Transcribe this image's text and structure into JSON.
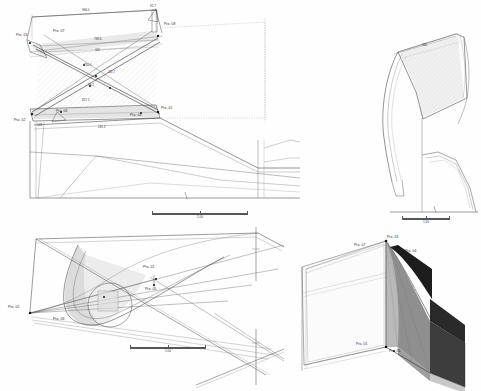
{
  "drawing": {
    "title": "Technical CAD Drawing - Four View Layout",
    "background_color": "#ffffff",
    "line_color": "#2b2b2b",
    "thin_line_color": "#6a6a6a",
    "dashed_color": "#8a8a8a"
  },
  "views": {
    "elevation": {
      "name": "Side Elevation / Scissor Linkage",
      "scale_label": "1.00",
      "points": [
        {
          "id": "p03",
          "label": "Pto. 03",
          "x": 24,
          "y": 36
        },
        {
          "id": "p07",
          "label": "Pto. 07",
          "x": 57,
          "y": 33
        },
        {
          "id": "p08",
          "label": "Pto. 08",
          "x": 162,
          "y": 25
        },
        {
          "id": "p01",
          "label": "Pto. 01",
          "x": 158,
          "y": 110
        },
        {
          "id": "p02",
          "label": "Pto. 02",
          "x": 21,
          "y": 121
        },
        {
          "id": "p06",
          "label": "Pto. 06",
          "x": 59,
          "y": 113
        },
        {
          "id": "p04",
          "label": "Pto. 04",
          "x": 137,
          "y": 115
        },
        {
          "id": "p05",
          "label": "Pto. 05",
          "x": 140,
          "y": 120
        }
      ],
      "dimensions": [
        {
          "id": "d1",
          "value": "966.0",
          "x": 84,
          "y": 12
        },
        {
          "id": "d2",
          "value": "788.6",
          "x": 96,
          "y": 40
        },
        {
          "id": "d3",
          "value": "341",
          "x": 96,
          "y": 51
        },
        {
          "id": "d4",
          "value": "857.1",
          "x": 84,
          "y": 100
        },
        {
          "id": "d5",
          "value": "281.3",
          "x": 100,
          "y": 128
        },
        {
          "id": "d6",
          "value": "143",
          "x": 39,
          "y": 126
        },
        {
          "id": "d7",
          "value": "92.7",
          "x": 152,
          "y": 7
        },
        {
          "id": "d8",
          "value": "250.4",
          "x": 86,
          "y": 66
        },
        {
          "id": "d9",
          "value": "311.7",
          "x": 110,
          "y": 73
        },
        {
          "id": "d10",
          "value": "96.2",
          "x": 90,
          "y": 86
        }
      ],
      "origin_marker": "⌒"
    },
    "section": {
      "name": "Front Section - Curved Panel",
      "scale_label": "1.00",
      "dimensions": [
        {
          "id": "s1",
          "value": "360",
          "x": 425,
          "y": 45
        }
      ],
      "hatch_opacity": 0.18
    },
    "plan": {
      "name": "Plan / Developed Surface",
      "scale_label": "1.00",
      "points": [
        {
          "id": "p02",
          "label": "Pto. 02",
          "x": 16,
          "y": 306
        },
        {
          "id": "p06",
          "label": "Pto. 06",
          "x": 60,
          "y": 318
        },
        {
          "id": "p01",
          "label": "Pto. 01",
          "x": 150,
          "y": 266
        },
        {
          "id": "p05",
          "label": "Pto. 05",
          "x": 152,
          "y": 288
        }
      ],
      "detail_circle": {
        "cx": 110,
        "cy": 305,
        "r": 22
      }
    },
    "isometric": {
      "name": "Isometric 3D Shaded View",
      "points": [
        {
          "id": "p03",
          "label": "Pto. 03",
          "x": 385,
          "y": 239
        },
        {
          "id": "p07",
          "label": "Pto. 07",
          "x": 357,
          "y": 246
        },
        {
          "id": "p04",
          "label": "Pto. 04",
          "x": 406,
          "y": 252
        },
        {
          "id": "p01",
          "label": "Pto. 01",
          "x": 358,
          "y": 340
        },
        {
          "id": "p05",
          "label": "Pto. 05",
          "x": 388,
          "y": 347
        }
      ],
      "shades": {
        "face_light": "#b9b9b9",
        "face_mid": "#8f8f8f",
        "face_dark": "#5a5a5a",
        "face_darkest": "#2e2e2e",
        "face_black": "#161616",
        "face_pale": "#d7d7d7"
      }
    }
  },
  "scale_bars": {
    "elevation": {
      "label": "1.00"
    },
    "section": {
      "label": "1.00"
    },
    "plan": {
      "label": "1.00"
    }
  }
}
